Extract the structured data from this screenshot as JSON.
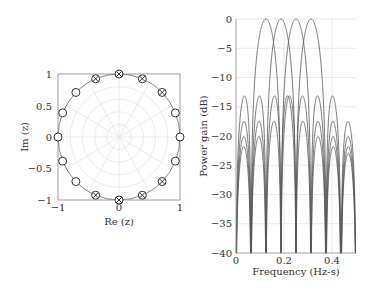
{
  "chart_data": [
    {
      "type": "scatter",
      "title": "",
      "xlabel": "Re (z)",
      "ylabel": "Im (z)",
      "xlim": [
        -1,
        1
      ],
      "ylim": [
        -1,
        1
      ],
      "xticks": [
        "-1",
        "0",
        "1"
      ],
      "yticks": [
        "1",
        "0.5",
        "0",
        "-0.5",
        "-1"
      ],
      "grid": "polar",
      "unit_circle": true,
      "series": [
        {
          "name": "zeros",
          "marker": "circle",
          "angles_deg": [
            0,
            22.5,
            135,
            157.5,
            180,
            202.5,
            225,
            337.5
          ]
        },
        {
          "name": "zeros-with-poles",
          "marker": "circle-x",
          "angles_deg": [
            45,
            67.5,
            90,
            112.5,
            247.5,
            270,
            292.5,
            315
          ]
        }
      ]
    },
    {
      "type": "line",
      "title": "",
      "xlabel": "Frequency (Hz-s)",
      "ylabel": "Power gain (dB)",
      "xlim": [
        0,
        0.5
      ],
      "ylim": [
        -40,
        0
      ],
      "xticks": [
        "0",
        "0.2",
        "0.4"
      ],
      "yticks": [
        "0",
        "-5",
        "-10",
        "-15",
        "-20",
        "-25",
        "-30",
        "-35",
        "-40"
      ],
      "grid": true,
      "filter_length": 16,
      "series": [
        {
          "name": "filter-1",
          "center_freq": 0.125,
          "peak_db": 0
        },
        {
          "name": "filter-2",
          "center_freq": 0.1875,
          "peak_db": 0
        },
        {
          "name": "filter-3",
          "center_freq": 0.25,
          "peak_db": 0
        },
        {
          "name": "filter-4",
          "center_freq": 0.3125,
          "peak_db": 0
        }
      ]
    }
  ],
  "left_chart": {
    "xlabel": "Re (z)",
    "ylabel": "Im (z)",
    "xtick_neg1": "−1",
    "xtick_0": "0",
    "xtick_1": "1",
    "ytick_1": "1",
    "ytick_05": "0.5",
    "ytick_0": "0",
    "ytick_neg05": "−0.5",
    "ytick_neg1": "−1"
  },
  "right_chart": {
    "xlabel": "Frequency (Hz-s)",
    "ylabel": "Power gain (dB)",
    "xticks": [
      "0",
      "0.2",
      "0.4"
    ],
    "yticks": [
      "0",
      "−5",
      "−10",
      "−15",
      "−20",
      "−25",
      "−30",
      "−35",
      "−40"
    ]
  },
  "colors": {
    "axis": "#888888",
    "grid": "#e2e2e2",
    "curve": "#555555",
    "marker": "#333333"
  }
}
